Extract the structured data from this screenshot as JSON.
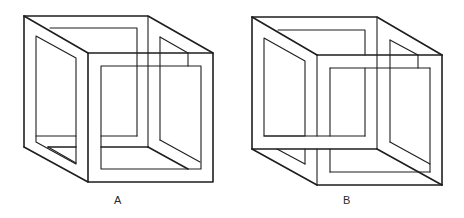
{
  "figures": [
    {
      "id": "A",
      "label": "A",
      "description": "Possible cube frame (Necker-style open cube)"
    },
    {
      "id": "B",
      "label": "B",
      "description": "Impossible cube frame (bars cross inconsistently)"
    }
  ],
  "colors": {
    "line": "#1e1e1e",
    "background": "#ffffff"
  }
}
